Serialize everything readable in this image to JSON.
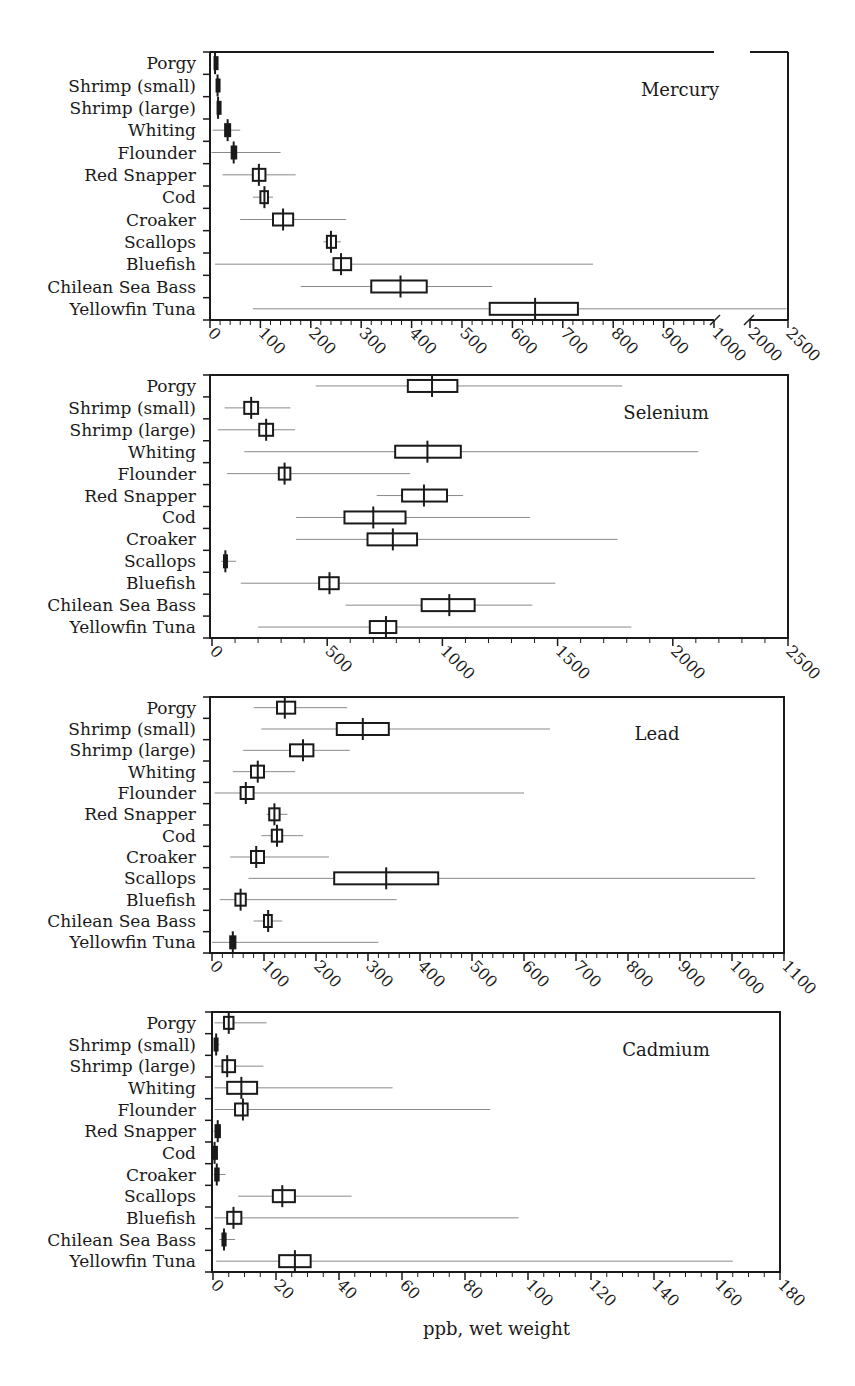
{
  "figure": {
    "xlabel": "ppb, wet weight",
    "ink_color": "#1a1a1a",
    "whisker_color": "#8a8a8a"
  },
  "chart_data": [
    {
      "type": "box",
      "title": "Mercury",
      "xlabel": "ppb, wet weight",
      "ylabel": "",
      "categories": [
        "Porgy",
        "Shrimp (small)",
        "Shrimp (large)",
        "Whiting",
        "Flounder",
        "Red Snapper",
        "Cod",
        "Croaker",
        "Scallops",
        "Bluefish",
        "Chilean Sea Bass",
        "Yellowfin Tuna"
      ],
      "xlim": [
        0,
        2500
      ],
      "axis_break": {
        "from": 1000,
        "to": 2000
      },
      "ticks": [
        0,
        100,
        200,
        300,
        400,
        500,
        600,
        700,
        800,
        900,
        1000,
        2000,
        2500
      ],
      "tick_labels": [
        "0",
        "100",
        "200",
        "300",
        "400",
        "500",
        "600",
        "700",
        "800",
        "900",
        "1000",
        "2000",
        "2500"
      ],
      "series": [
        {
          "name": "Porgy",
          "min": 8,
          "q1": 9,
          "median": 10,
          "q3": 12,
          "max": 14
        },
        {
          "name": "Shrimp (small)",
          "min": 14,
          "q1": 13,
          "median": 15,
          "q3": 17,
          "max": 18
        },
        {
          "name": "Shrimp (large)",
          "min": 14,
          "q1": 15,
          "median": 16,
          "q3": 17,
          "max": 18
        },
        {
          "name": "Whiting",
          "min": 5,
          "q1": 30,
          "median": 35,
          "q3": 40,
          "max": 60
        },
        {
          "name": "Flounder",
          "min": 3,
          "q1": 43,
          "median": 47,
          "q3": 52,
          "max": 140
        },
        {
          "name": "Red Snapper",
          "min": 25,
          "q1": 85,
          "median": 97,
          "q3": 110,
          "max": 170
        },
        {
          "name": "Cod",
          "min": 85,
          "q1": 100,
          "median": 108,
          "q3": 115,
          "max": 125
        },
        {
          "name": "Croaker",
          "min": 60,
          "q1": 125,
          "median": 145,
          "q3": 165,
          "max": 270
        },
        {
          "name": "Scallops",
          "min": 225,
          "q1": 232,
          "median": 240,
          "q3": 250,
          "max": 260
        },
        {
          "name": "Bluefish",
          "min": 10,
          "q1": 245,
          "median": 260,
          "q3": 280,
          "max": 760
        },
        {
          "name": "Chilean Sea Bass",
          "min": 180,
          "q1": 320,
          "median": 378,
          "q3": 430,
          "max": 560
        },
        {
          "name": "Yellowfin Tuna",
          "min": 85,
          "q1": 555,
          "median": 645,
          "q3": 730,
          "max": 2480
        }
      ],
      "grid": false,
      "legend": "none"
    },
    {
      "type": "box",
      "title": "Selenium",
      "xlabel": "ppb, wet weight",
      "categories": [
        "Porgy",
        "Shrimp (small)",
        "Shrimp (large)",
        "Whiting",
        "Flounder",
        "Red Snapper",
        "Cod",
        "Croaker",
        "Scallops",
        "Bluefish",
        "Chilean Sea Bass",
        "Yellowfin Tuna"
      ],
      "xlim": [
        0,
        2500
      ],
      "ticks": [
        0,
        500,
        1000,
        1500,
        2000,
        2500
      ],
      "tick_labels": [
        "0",
        "500",
        "1000",
        "1500",
        "2000",
        "2500"
      ],
      "series": [
        {
          "name": "Porgy",
          "min": 450,
          "q1": 850,
          "median": 955,
          "q3": 1065,
          "max": 1780
        },
        {
          "name": "Shrimp (small)",
          "min": 55,
          "q1": 140,
          "median": 170,
          "q3": 200,
          "max": 340
        },
        {
          "name": "Shrimp (large)",
          "min": 25,
          "q1": 205,
          "median": 235,
          "q3": 265,
          "max": 360
        },
        {
          "name": "Whiting",
          "min": 140,
          "q1": 795,
          "median": 935,
          "q3": 1080,
          "max": 2110
        },
        {
          "name": "Flounder",
          "min": 65,
          "q1": 290,
          "median": 315,
          "q3": 340,
          "max": 860
        },
        {
          "name": "Red Snapper",
          "min": 715,
          "q1": 825,
          "median": 920,
          "q3": 1020,
          "max": 1090
        },
        {
          "name": "Cod",
          "min": 365,
          "q1": 575,
          "median": 700,
          "q3": 840,
          "max": 1380
        },
        {
          "name": "Croaker",
          "min": 365,
          "q1": 675,
          "median": 785,
          "q3": 890,
          "max": 1760
        },
        {
          "name": "Scallops",
          "min": 40,
          "q1": 52,
          "median": 58,
          "q3": 65,
          "max": 105
        },
        {
          "name": "Bluefish",
          "min": 125,
          "q1": 465,
          "median": 510,
          "q3": 550,
          "max": 1490
        },
        {
          "name": "Chilean Sea Bass",
          "min": 580,
          "q1": 910,
          "median": 1030,
          "q3": 1140,
          "max": 1390
        },
        {
          "name": "Yellowfin Tuna",
          "min": 200,
          "q1": 685,
          "median": 755,
          "q3": 800,
          "max": 1820
        }
      ],
      "grid": false,
      "legend": "none"
    },
    {
      "type": "box",
      "title": "Lead",
      "xlabel": "ppb, wet weight",
      "categories": [
        "Porgy",
        "Shrimp (small)",
        "Shrimp (large)",
        "Whiting",
        "Flounder",
        "Red Snapper",
        "Cod",
        "Croaker",
        "Scallops",
        "Bluefish",
        "Chilean Sea Bass",
        "Yellowfin Tuna"
      ],
      "xlim": [
        0,
        1100
      ],
      "ticks": [
        0,
        100,
        200,
        300,
        400,
        500,
        600,
        700,
        800,
        900,
        1000,
        1100
      ],
      "tick_labels": [
        "0",
        "100",
        "200",
        "300",
        "400",
        "500",
        "600",
        "700",
        "800",
        "900",
        "1000",
        "1100"
      ],
      "series": [
        {
          "name": "Porgy",
          "min": 80,
          "q1": 125,
          "median": 140,
          "q3": 160,
          "max": 260
        },
        {
          "name": "Shrimp (small)",
          "min": 95,
          "q1": 240,
          "median": 290,
          "q3": 340,
          "max": 650
        },
        {
          "name": "Shrimp (large)",
          "min": 60,
          "q1": 150,
          "median": 175,
          "q3": 195,
          "max": 265
        },
        {
          "name": "Whiting",
          "min": 40,
          "q1": 75,
          "median": 88,
          "q3": 100,
          "max": 160
        },
        {
          "name": "Flounder",
          "min": 5,
          "q1": 55,
          "median": 65,
          "q3": 80,
          "max": 600
        },
        {
          "name": "Red Snapper",
          "min": 105,
          "q1": 110,
          "median": 120,
          "q3": 130,
          "max": 145
        },
        {
          "name": "Cod",
          "min": 95,
          "q1": 115,
          "median": 125,
          "q3": 135,
          "max": 175
        },
        {
          "name": "Croaker",
          "min": 35,
          "q1": 75,
          "median": 85,
          "q3": 100,
          "max": 225
        },
        {
          "name": "Scallops",
          "min": 70,
          "q1": 235,
          "median": 335,
          "q3": 435,
          "max": 1045
        },
        {
          "name": "Bluefish",
          "min": 15,
          "q1": 45,
          "median": 55,
          "q3": 65,
          "max": 355
        },
        {
          "name": "Chilean Sea Bass",
          "min": 80,
          "q1": 100,
          "median": 108,
          "q3": 115,
          "max": 135
        },
        {
          "name": "Yellowfin Tuna",
          "min": 0,
          "q1": 35,
          "median": 40,
          "q3": 45,
          "max": 320
        }
      ],
      "grid": false,
      "legend": "none"
    },
    {
      "type": "box",
      "title": "Cadmium",
      "xlabel": "ppb, wet weight",
      "categories": [
        "Porgy",
        "Shrimp (small)",
        "Shrimp (large)",
        "Whiting",
        "Flounder",
        "Red Snapper",
        "Cod",
        "Croaker",
        "Scallops",
        "Bluefish",
        "Chilean Sea Bass",
        "Yellowfin Tuna"
      ],
      "xlim": [
        0,
        180
      ],
      "ticks": [
        0,
        20,
        40,
        60,
        80,
        100,
        120,
        140,
        160,
        180
      ],
      "tick_labels": [
        "0",
        "20",
        "40",
        "60",
        "80",
        "100",
        "120",
        "140",
        "160",
        "180"
      ],
      "series": [
        {
          "name": "Porgy",
          "min": 0.5,
          "q1": 3.5,
          "median": 5,
          "q3": 6.5,
          "max": 17
        },
        {
          "name": "Shrimp (small)",
          "min": 0.5,
          "q1": 0.5,
          "median": 1,
          "q3": 1,
          "max": 2
        },
        {
          "name": "Shrimp (large)",
          "min": 0.5,
          "q1": 3,
          "median": 4.5,
          "q3": 7,
          "max": 16
        },
        {
          "name": "Whiting",
          "min": 0.5,
          "q1": 4.5,
          "median": 9,
          "q3": 14,
          "max": 57
        },
        {
          "name": "Flounder",
          "min": 0.5,
          "q1": 7,
          "median": 9.5,
          "q3": 11,
          "max": 88
        },
        {
          "name": "Red Snapper",
          "min": 0.2,
          "q1": 0.8,
          "median": 1.5,
          "q3": 2.2,
          "max": 2.5
        },
        {
          "name": "Cod",
          "min": 0.1,
          "q1": 0.3,
          "median": 0.5,
          "q3": 0.7,
          "max": 1
        },
        {
          "name": "Croaker",
          "min": 0.2,
          "q1": 0.7,
          "median": 1.2,
          "q3": 1.8,
          "max": 4
        },
        {
          "name": "Scallops",
          "min": 8,
          "q1": 19,
          "median": 22,
          "q3": 26,
          "max": 44
        },
        {
          "name": "Bluefish",
          "min": 0.5,
          "q1": 4.5,
          "median": 6.5,
          "q3": 9,
          "max": 97
        },
        {
          "name": "Chilean Sea Bass",
          "min": 2,
          "q1": 3,
          "median": 3.5,
          "q3": 4,
          "max": 7
        },
        {
          "name": "Yellowfin Tuna",
          "min": 1,
          "q1": 21,
          "median": 26,
          "q3": 31,
          "max": 165
        }
      ],
      "grid": false,
      "legend": "none"
    }
  ],
  "panels": [
    {
      "key": "mercury",
      "title": "Mercury",
      "box": [
        210,
        52,
        788,
        320
      ],
      "title_pos": [
        680,
        96
      ],
      "scale": {
        "type": "broken",
        "seg1": [
          0,
          1000,
          210,
          714
        ],
        "seg2": [
          2000,
          2500,
          750,
          788
        ]
      },
      "minor_step": 20,
      "minor_max": 1000
    },
    {
      "key": "selenium",
      "title": "Selenium",
      "box": [
        210,
        375,
        788,
        638
      ],
      "title_pos": [
        666,
        419
      ],
      "scale": {
        "type": "linear",
        "dom": [
          0,
          2500
        ],
        "px": [
          212,
          788
        ]
      },
      "minor_step": 100,
      "minor_max": 2500
    },
    {
      "key": "lead",
      "title": "Lead",
      "box": [
        210,
        697,
        784,
        953
      ],
      "title_pos": [
        657,
        740
      ],
      "scale": {
        "type": "linear",
        "dom": [
          0,
          1100
        ],
        "px": [
          212,
          784
        ]
      },
      "minor_step": 20,
      "minor_max": 1100
    },
    {
      "key": "cadmium",
      "title": "Cadmium",
      "box": [
        212,
        1012,
        780,
        1272
      ],
      "title_pos": [
        666,
        1056
      ],
      "scale": {
        "type": "linear",
        "dom": [
          0,
          180
        ],
        "px": [
          213,
          780
        ]
      },
      "minor_step": 5,
      "minor_max": 180
    }
  ]
}
